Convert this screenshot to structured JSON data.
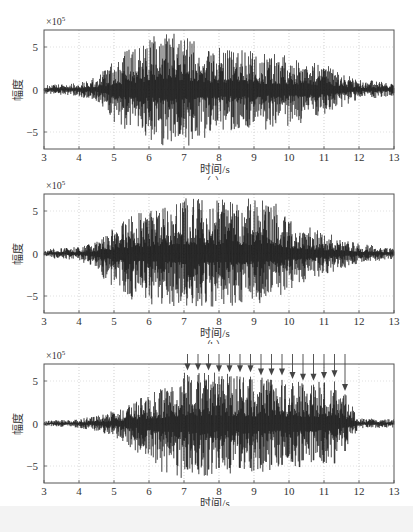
{
  "figure": {
    "ylabel": "幅度",
    "xlabel": "时间/s",
    "exponent_label": "×10",
    "exponent_power": "5",
    "panels": [
      {
        "id": "a",
        "caption": "（a）"
      },
      {
        "id": "b",
        "caption": "（b）"
      },
      {
        "id": "c",
        "caption": "（c）"
      }
    ],
    "xticks": [
      "3",
      "4",
      "5",
      "6",
      "7",
      "8",
      "9",
      "10",
      "11",
      "12",
      "13"
    ],
    "yticks": [
      "5",
      "0",
      "-5"
    ]
  },
  "chart_data": [
    {
      "type": "line",
      "title": "(a)",
      "xlabel": "时间/s",
      "ylabel": "幅度",
      "y_scale_note": "×10^5",
      "xlim": [
        3,
        13
      ],
      "ylim": [
        -7,
        7
      ],
      "xticks": [
        3,
        4,
        5,
        6,
        7,
        8,
        9,
        10,
        11,
        12,
        13
      ],
      "yticks": [
        -5,
        0,
        5
      ],
      "grid": "vertical dotted at integer seconds",
      "description": "Oscillatory signal; small amplitude (~±0.5) from 3-4.5s, grows to peak ~±7 around 6-7s, envelope gradually decays to ~±1 by 11.5-13s",
      "envelope": {
        "x": [
          3,
          4,
          4.5,
          5,
          5.5,
          6,
          6.5,
          7,
          8,
          9,
          10,
          11,
          12,
          13
        ],
        "upper": [
          0.5,
          0.8,
          1.5,
          3.5,
          5.0,
          6.0,
          7.0,
          6.5,
          5.0,
          4.5,
          4.0,
          3.0,
          1.2,
          0.8
        ],
        "lower": [
          -0.5,
          -0.8,
          -1.5,
          -4.0,
          -5.5,
          -6.0,
          -7.0,
          -7.0,
          -5.0,
          -5.0,
          -4.5,
          -3.0,
          -1.2,
          -0.8
        ]
      }
    },
    {
      "type": "line",
      "title": "(b)",
      "xlabel": "时间/s",
      "ylabel": "幅度",
      "y_scale_note": "×10^5",
      "xlim": [
        3,
        13
      ],
      "ylim": [
        -7,
        7
      ],
      "xticks": [
        3,
        4,
        5,
        6,
        7,
        8,
        9,
        10,
        11,
        12,
        13
      ],
      "yticks": [
        -5,
        0,
        5
      ],
      "grid": "vertical dotted at integer seconds",
      "description": "Oscillatory signal with larger sustained amplitude; builds from 4.5s, dense peaks ~±6.5 between 6 and 9.5s, decays after 10s",
      "envelope": {
        "x": [
          3,
          4,
          4.5,
          5,
          5.5,
          6,
          7,
          8,
          9,
          9.5,
          10,
          11,
          12,
          13
        ],
        "upper": [
          0.5,
          0.8,
          1.5,
          3.0,
          4.5,
          5.5,
          6.5,
          6.5,
          6.5,
          6.5,
          4.0,
          2.5,
          1.2,
          0.6
        ],
        "lower": [
          -0.5,
          -0.8,
          -2.0,
          -4.5,
          -5.5,
          -6.0,
          -6.5,
          -6.5,
          -6.0,
          -5.5,
          -4.5,
          -2.5,
          -1.2,
          -0.6
        ]
      }
    },
    {
      "type": "line",
      "title": "(c)",
      "xlabel": "时间/s",
      "ylabel": "幅度",
      "y_scale_note": "×10^5",
      "xlim": [
        3,
        13
      ],
      "ylim": [
        -7,
        7
      ],
      "xticks": [
        3,
        4,
        5,
        6,
        7,
        8,
        9,
        10,
        11,
        12,
        13
      ],
      "yticks": [
        -5,
        0,
        5
      ],
      "grid": "vertical dotted at integer seconds",
      "description": "Periodic impulsive peaks (~0.3 s spacing) between 7 and 11.6 s marked by downward arrows; low amplitude outside that window",
      "annotations": {
        "type": "arrows",
        "x": [
          7.1,
          7.4,
          7.7,
          8.0,
          8.3,
          8.6,
          8.9,
          9.2,
          9.5,
          9.8,
          10.1,
          10.4,
          10.7,
          11.0,
          11.3,
          11.6
        ],
        "tip_y": [
          6.0,
          6.0,
          6.0,
          5.8,
          5.8,
          5.8,
          5.8,
          5.4,
          5.4,
          5.4,
          5.0,
          4.8,
          4.8,
          5.0,
          5.2,
          3.6
        ]
      },
      "envelope": {
        "x": [
          3,
          4,
          5,
          6,
          6.5,
          7,
          8,
          9,
          10,
          11,
          11.6,
          12,
          13
        ],
        "upper": [
          0.3,
          0.5,
          1.5,
          3.5,
          4.5,
          6.0,
          6.0,
          5.5,
          5.2,
          5.0,
          3.6,
          0.6,
          0.5
        ],
        "lower": [
          -0.3,
          -0.5,
          -1.5,
          -4.5,
          -6.5,
          -6.5,
          -6.0,
          -5.8,
          -5.5,
          -5.0,
          -3.0,
          -0.6,
          -0.5
        ]
      }
    }
  ]
}
